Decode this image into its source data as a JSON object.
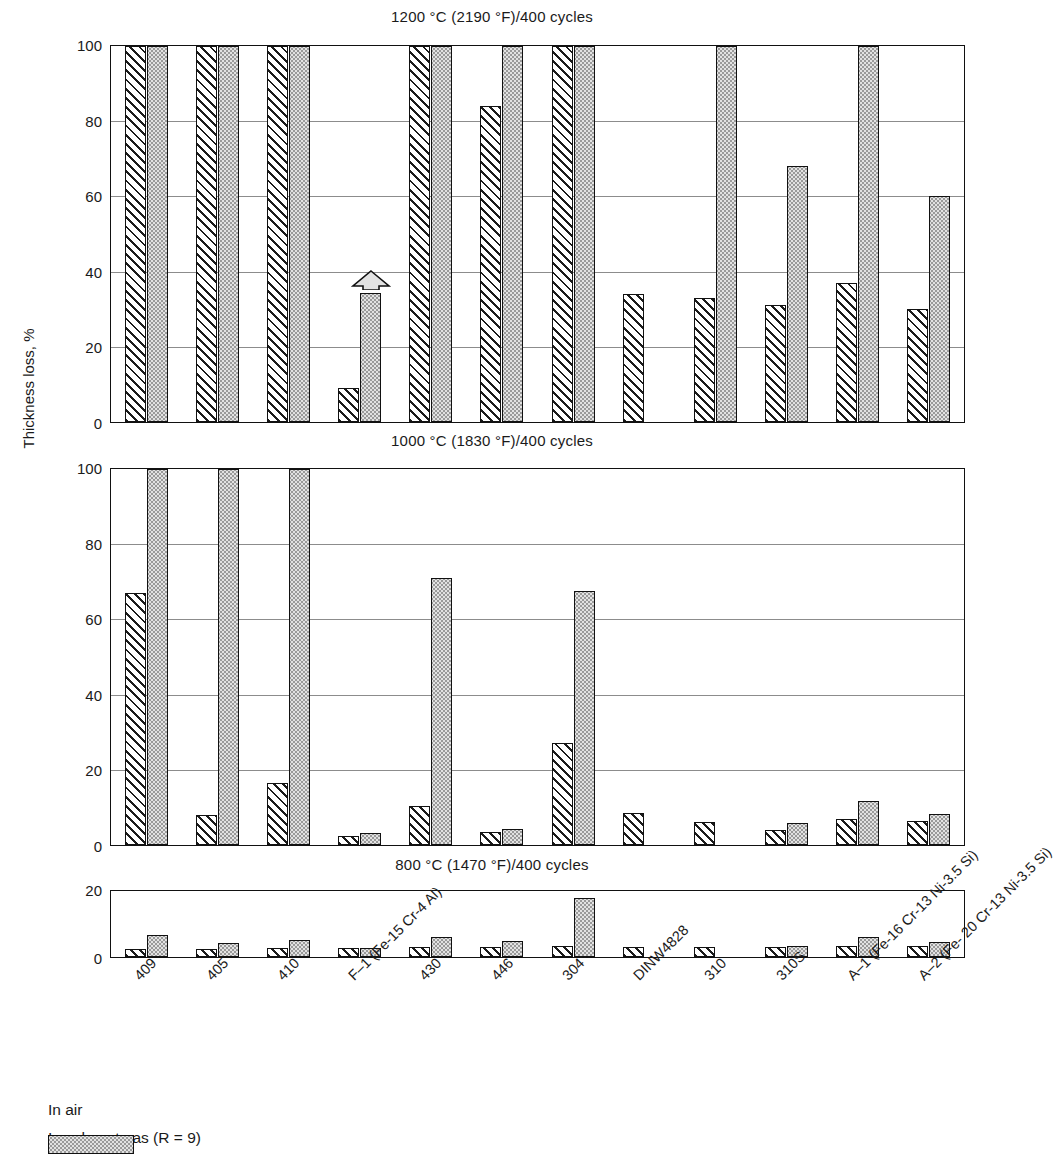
{
  "figure": {
    "y_axis_label": "Thickness loss, %",
    "legend": [
      {
        "key": "air",
        "label": "In air",
        "pattern": "diagonal-hatch"
      },
      {
        "key": "exhaust",
        "label": "In exhaust gas (R = 9)",
        "pattern": "stipple-dot"
      }
    ],
    "categories": [
      "409",
      "405",
      "410",
      "F–1 (Fe-15 Cr-4 Al)",
      "430",
      "446",
      "304",
      "DINW4828",
      "310",
      "310S",
      "A–1 (Fe-16 Cr-13 Ni-3.5 Si)",
      "A–2 (Fe- 20 Cr-13 Ni-3.5 Si)"
    ],
    "panels": [
      {
        "id": "panel-1",
        "title": "1200 °C (2190 °F)/400 cycles",
        "yticks": [
          0,
          20,
          40,
          60,
          80,
          100
        ],
        "ymax": 100
      },
      {
        "id": "panel-2",
        "title": "1000 °C (1830 °F)/400 cycles",
        "yticks": [
          0,
          20,
          40,
          60,
          80,
          100
        ],
        "ymax": 100
      },
      {
        "id": "panel-3",
        "title": "800 °C (1470 °F)/400 cycles",
        "yticks": [
          0,
          20
        ],
        "ymax": 20
      }
    ]
  },
  "chart_data": [
    {
      "type": "bar",
      "title": "1200 °C (2190 °F)/400 cycles",
      "xlabel": "",
      "ylabel": "Thickness loss, %",
      "ylim": [
        0,
        100
      ],
      "yticks": [
        0,
        20,
        40,
        60,
        80,
        100
      ],
      "grid": true,
      "legend_position": "bottom",
      "categories": [
        "409",
        "405",
        "410",
        "F–1 (Fe-15 Cr-4 Al)",
        "430",
        "446",
        "304",
        "DINW4828",
        "310",
        "310S",
        "A–1 (Fe-16 Cr-13 Ni-3.5 Si)",
        "A–2 (Fe- 20 Cr-13 Ni-3.5 Si)"
      ],
      "series": [
        {
          "name": "In air",
          "values": [
            100,
            100,
            100,
            9,
            100,
            84,
            100,
            34,
            33,
            31,
            37,
            30
          ]
        },
        {
          "name": "In exhaust gas (R = 9)",
          "values": [
            100,
            100,
            100,
            38.5,
            100,
            100,
            100,
            null,
            100,
            68,
            100,
            60
          ]
        }
      ],
      "annotations": [
        {
          "category": "F–1 (Fe-15 Cr-4 Al)",
          "series": "In exhaust gas (R = 9)",
          "marker": "up-arrow",
          "note": "value exceeds axis"
        }
      ]
    },
    {
      "type": "bar",
      "title": "1000 °C (1830 °F)/400 cycles",
      "xlabel": "",
      "ylabel": "Thickness loss, %",
      "ylim": [
        0,
        100
      ],
      "yticks": [
        0,
        20,
        40,
        60,
        80,
        100
      ],
      "grid": true,
      "legend_position": "bottom",
      "categories": [
        "409",
        "405",
        "410",
        "F–1 (Fe-15 Cr-4 Al)",
        "430",
        "446",
        "304",
        "DINW4828",
        "310",
        "310S",
        "A–1 (Fe-16 Cr-13 Ni-3.5 Si)",
        "A–2 (Fe- 20 Cr-13 Ni-3.5 Si)"
      ],
      "series": [
        {
          "name": "In air",
          "values": [
            67,
            8,
            16.5,
            2.5,
            10.5,
            3.5,
            27,
            8.6,
            6,
            4,
            7,
            6.5
          ]
        },
        {
          "name": "In exhaust gas (R = 9)",
          "values": [
            100,
            100,
            100,
            3.3,
            71,
            4.3,
            67.5,
            null,
            null,
            5.8,
            11.6,
            8.3
          ]
        }
      ]
    },
    {
      "type": "bar",
      "title": "800 °C (1470 °F)/400 cycles",
      "xlabel": "",
      "ylabel": "Thickness loss, %",
      "ylim": [
        0,
        20
      ],
      "yticks": [
        0,
        20
      ],
      "grid": false,
      "legend_position": "bottom",
      "categories": [
        "409",
        "405",
        "410",
        "F–1 (Fe-15 Cr-4 Al)",
        "430",
        "446",
        "304",
        "DINW4828",
        "310",
        "310S",
        "A–1 (Fe-16 Cr-13 Ni-3.5 Si)",
        "A–2 (Fe- 20 Cr-13 Ni-3.5 Si)"
      ],
      "series": [
        {
          "name": "In air",
          "values": [
            2.3,
            2.4,
            2.6,
            2.8,
            3.0,
            3.1,
            3.2,
            3.1,
            3.0,
            3.1,
            3.3,
            3.3
          ]
        },
        {
          "name": "In exhaust gas (R = 9)",
          "values": [
            6.6,
            4.2,
            5.2,
            2.8,
            6.1,
            4.8,
            18.0,
            null,
            null,
            3.3,
            6.2,
            4.6
          ]
        }
      ]
    }
  ]
}
